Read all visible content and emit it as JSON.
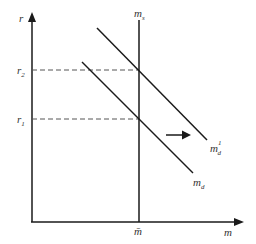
{
  "diagram": {
    "type": "money-market-supply-demand",
    "axes": {
      "y_label": "r",
      "x_label": "m"
    },
    "levels": {
      "r1": {
        "label": "r",
        "sub": "1"
      },
      "r2": {
        "label": "r",
        "sub": "2"
      }
    },
    "x_marker": {
      "label": "m̄"
    },
    "curves": {
      "supply": {
        "label": "m",
        "sub": "s",
        "kind": "vertical"
      },
      "demand": {
        "label": "m",
        "sub": "d"
      },
      "demand_shifted": {
        "label": "m",
        "sub": "d",
        "sup": "1"
      }
    },
    "shift_arrow": {
      "direction": "right"
    },
    "colors": {
      "line": "#1a1a1a",
      "dashed": "#555555",
      "text": "#333333"
    }
  }
}
